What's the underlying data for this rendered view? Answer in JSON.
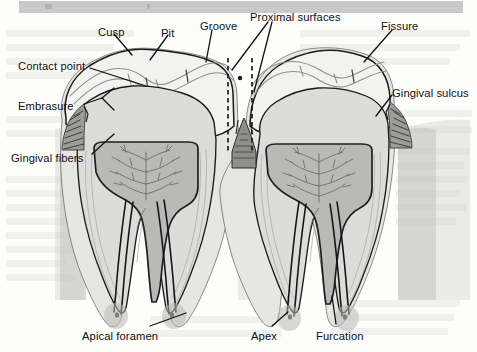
{
  "figure": {
    "kind": "anatomical-illustration",
    "tooth_count": 2,
    "top_band": {
      "present": true,
      "color": "#c9c9c9"
    },
    "page_background": "#fdfdfc"
  },
  "palette": {
    "outline": "#1a1a1a",
    "enamel": "#f2f2f0",
    "enamel_edge": "#9a9a98",
    "dentin": "#dcdcda",
    "dentin_edge": "#8d8d8b",
    "pulp": "#b9b9b7",
    "pulp_edge": "#2b2b2b",
    "gingiva": "#9c9c9a",
    "bone": "#c4c4c2",
    "cementum": "#cfcfcd",
    "canal": "#1a1a1a",
    "leader": "#111111",
    "dashed": "#111111",
    "label_text": "#101010"
  },
  "labels": [
    {
      "id": "cusp",
      "text": "Cusp",
      "x": 98,
      "y": 26,
      "side": "top-left"
    },
    {
      "id": "pit",
      "text": "Pit",
      "x": 161,
      "y": 27,
      "side": "top-left"
    },
    {
      "id": "groove",
      "text": "Groove",
      "x": 200,
      "y": 20,
      "side": "top-center"
    },
    {
      "id": "proximal-surfaces",
      "text": "Proximal surfaces",
      "x": 250,
      "y": 11,
      "side": "top-center"
    },
    {
      "id": "fissure",
      "text": "Fissure",
      "x": 381,
      "y": 20,
      "side": "top-right"
    },
    {
      "id": "contact-point",
      "text": "Contact point",
      "x": 18,
      "y": 60,
      "side": "left"
    },
    {
      "id": "embrasure",
      "text": "Embrasure",
      "x": 18,
      "y": 100,
      "side": "left"
    },
    {
      "id": "gingival-fibers",
      "text": "Gingival fibers",
      "x": 11,
      "y": 152,
      "side": "left"
    },
    {
      "id": "gingival-sulcus",
      "text": "Gingival sulcus",
      "x": 392,
      "y": 87,
      "side": "right"
    },
    {
      "id": "apical-foramen",
      "text": "Apical foramen",
      "x": 82,
      "y": 330,
      "side": "bottom-left"
    },
    {
      "id": "apex",
      "text": "Apex",
      "x": 251,
      "y": 330,
      "side": "bottom-center"
    },
    {
      "id": "furcation",
      "text": "Furcation",
      "x": 316,
      "y": 330,
      "side": "bottom-right"
    }
  ],
  "anatomy_parts": [
    "enamel",
    "dentin",
    "pulp chamber",
    "pulp horns",
    "root canal",
    "cementum",
    "periodontal ligament",
    "alveolar bone",
    "gingiva",
    "interdental papilla",
    "gingival sulcus",
    "gingival fibers"
  ]
}
